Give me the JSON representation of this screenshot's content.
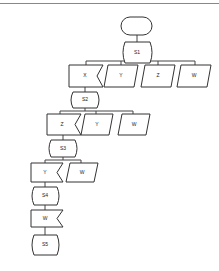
{
  "diagram": {
    "type": "flowchart",
    "start": {
      "label": ""
    },
    "steps": [
      {
        "id": "S1",
        "label": "S1",
        "branches": [
          {
            "label": "X",
            "shape": "notched"
          },
          {
            "label": "Y",
            "shape": "parallelogram"
          },
          {
            "label": "Z",
            "shape": "parallelogram"
          },
          {
            "label": "W",
            "shape": "parallelogram"
          }
        ]
      },
      {
        "id": "S2",
        "label": "S2",
        "branches": [
          {
            "label": "Z",
            "shape": "notched"
          },
          {
            "label": "Y",
            "shape": "parallelogram"
          },
          {
            "label": "W",
            "shape": "parallelogram"
          }
        ]
      },
      {
        "id": "S3",
        "label": "S3",
        "branches": [
          {
            "label": "Y",
            "shape": "notched"
          },
          {
            "label": "W",
            "shape": "parallelogram"
          }
        ]
      },
      {
        "id": "S4",
        "label": "S4",
        "branches": [
          {
            "label": "W",
            "shape": "notched"
          }
        ]
      },
      {
        "id": "S5",
        "label": "S5",
        "branches": []
      }
    ]
  }
}
